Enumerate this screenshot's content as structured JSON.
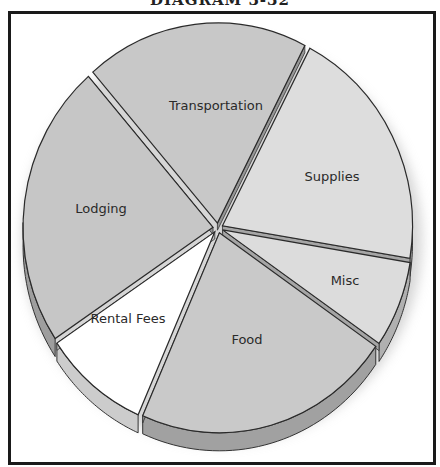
{
  "title": "DIAGRAM 3-32",
  "chart_data": {
    "type": "pie",
    "title": "DIAGRAM 3-32",
    "style": "3d-exploded",
    "legend": "none",
    "labels_inside": true,
    "slices": [
      {
        "label": "Transportation",
        "value": 19,
        "color": "#c8c8c8",
        "label_pos": [
          216,
          110
        ]
      },
      {
        "label": "Supplies",
        "value": 20,
        "color": "#dddddd",
        "label_pos": [
          332,
          181
        ]
      },
      {
        "label": "Misc",
        "value": 7,
        "color": "#dcdcdc",
        "label_pos": [
          345,
          285
        ]
      },
      {
        "label": "Food",
        "value": 22,
        "color": "#c9c9c9",
        "label_pos": [
          247,
          344
        ]
      },
      {
        "label": "Rental Fees",
        "value": 9,
        "color": "#ffffff",
        "label_pos": [
          128,
          323
        ]
      },
      {
        "label": "Lodging",
        "value": 23,
        "color": "#c6c6c6",
        "label_pos": [
          101,
          213
        ]
      }
    ]
  }
}
